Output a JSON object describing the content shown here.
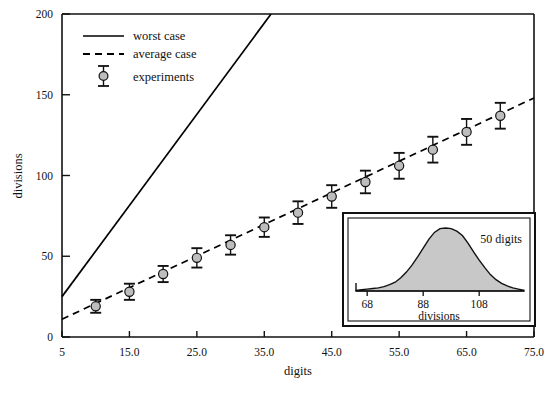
{
  "chart_data": {
    "type": "scatter",
    "title": "",
    "xlabel": "digits",
    "ylabel": "divisions",
    "xlim": [
      5,
      75
    ],
    "ylim": [
      0,
      200
    ],
    "grid": false,
    "xticks": [
      5,
      15,
      25,
      35,
      45,
      55,
      65,
      75
    ],
    "xticklabels": [
      "5",
      "15.0",
      "25.0",
      "35.0",
      "45.0",
      "55.0",
      "65.0",
      "75.0"
    ],
    "yticks": [
      0,
      50,
      100,
      150,
      200
    ],
    "yticklabels": [
      "0",
      "50",
      "100",
      "150",
      "200"
    ],
    "legend_position": "upper left",
    "legend": [
      {
        "label": "worst case",
        "style": "solid-line"
      },
      {
        "label": "average case",
        "style": "dashed-line"
      },
      {
        "label": "experiments",
        "style": "errorbar-marker"
      }
    ],
    "series": [
      {
        "name": "worst case",
        "style": "solid-line",
        "x": [
          5,
          36
        ],
        "values": [
          25,
          200
        ]
      },
      {
        "name": "average case",
        "style": "dashed-line",
        "x": [
          5,
          75
        ],
        "values": [
          11,
          148
        ]
      },
      {
        "name": "experiments",
        "style": "errorbar-marker",
        "x": [
          10,
          15,
          20,
          25,
          30,
          35,
          40,
          45,
          50,
          55,
          60,
          65,
          70
        ],
        "values": [
          19,
          28,
          39,
          49,
          57,
          68,
          77,
          87,
          96,
          106,
          116,
          127,
          137
        ],
        "yerr": [
          4,
          5,
          5,
          6,
          6,
          6,
          7,
          7,
          7,
          8,
          8,
          8,
          8
        ]
      }
    ],
    "inset": {
      "type": "area",
      "title": "50 digits",
      "xlabel": "divisions",
      "xticks": [
        68,
        88,
        108
      ],
      "xticklabels": [
        "68",
        "88",
        "108"
      ],
      "xlim": [
        64,
        124
      ],
      "density_x": [
        64,
        66,
        68,
        70,
        72,
        74,
        76,
        78,
        80,
        82,
        84,
        86,
        88,
        90,
        92,
        94,
        96,
        98,
        100,
        102,
        104,
        106,
        108,
        110,
        112,
        114,
        116,
        118,
        120,
        122,
        124
      ],
      "density_y": [
        0.01,
        0.02,
        0.03,
        0.04,
        0.05,
        0.07,
        0.1,
        0.14,
        0.21,
        0.3,
        0.41,
        0.54,
        0.68,
        0.82,
        0.93,
        0.99,
        1.0,
        0.99,
        0.95,
        0.88,
        0.76,
        0.62,
        0.49,
        0.37,
        0.26,
        0.18,
        0.12,
        0.08,
        0.05,
        0.03,
        0.01
      ]
    }
  },
  "colors": {
    "axis": "#111111",
    "line": "#000000",
    "marker_fill": "#bdbdbd",
    "marker_edge": "#111111",
    "inset_fill": "#c8c8c8",
    "inset_border": "#111111",
    "background": "#ffffff"
  }
}
